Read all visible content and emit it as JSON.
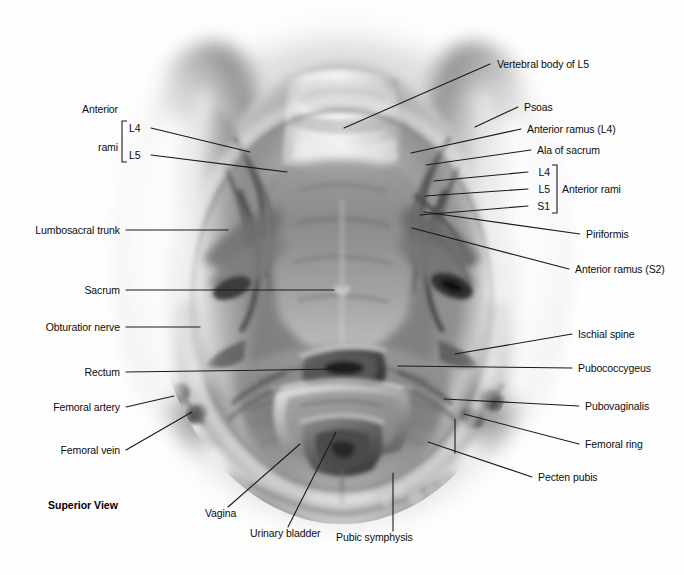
{
  "figure": {
    "view_label": "Superior View",
    "background_color": "#ffffff",
    "label_color": "#0d0d0d",
    "leader_color": "#1a1a1a",
    "width": 684,
    "height": 575
  },
  "brackets": {
    "left": {
      "title_line1": "Anterior",
      "title_line2": "rami",
      "items": [
        "L4",
        "L5"
      ]
    },
    "right": {
      "title": "Anterior rami",
      "items": [
        "L4",
        "L5",
        "S1"
      ]
    }
  },
  "labels": {
    "left": [
      {
        "text": "Lumbosacral trunk",
        "x": 120,
        "y": 230
      },
      {
        "text": "Sacrum",
        "x": 120,
        "y": 290
      },
      {
        "text": "Obturatior nerve",
        "x": 120,
        "y": 327
      },
      {
        "text": "Rectum",
        "x": 120,
        "y": 372
      },
      {
        "text": "Femoral artery",
        "x": 120,
        "y": 407
      },
      {
        "text": "Femoral vein",
        "x": 120,
        "y": 450
      }
    ],
    "right": [
      {
        "text": "Vertebral body of L5",
        "x": 497,
        "y": 64
      },
      {
        "text": "Psoas",
        "x": 524,
        "y": 107
      },
      {
        "text": "Anterior ramus (L4)",
        "x": 527,
        "y": 129
      },
      {
        "text": "Ala of sacrum",
        "x": 537,
        "y": 150
      },
      {
        "text": "Piriformis",
        "x": 586,
        "y": 234
      },
      {
        "text": "Anterior ramus (S2)",
        "x": 575,
        "y": 269
      },
      {
        "text": "Ischial spine",
        "x": 578,
        "y": 334
      },
      {
        "text": "Pubococcygeus",
        "x": 578,
        "y": 368
      },
      {
        "text": "Pubovaginalis",
        "x": 585,
        "y": 406
      },
      {
        "text": "Femoral ring",
        "x": 585,
        "y": 444
      },
      {
        "text": "Pecten pubis",
        "x": 538,
        "y": 477
      }
    ],
    "bottom": [
      {
        "text": "Vagina",
        "x": 205,
        "y": 513
      },
      {
        "text": "Urinary bladder",
        "x": 250,
        "y": 533
      },
      {
        "text": "Pubic symphysis",
        "x": 336,
        "y": 537
      }
    ]
  },
  "leaders": [
    {
      "name": "lumbosacral-trunk",
      "points": "126,230 228,230"
    },
    {
      "name": "sacrum",
      "points": "126,290 334,290"
    },
    {
      "name": "obturator-nerve",
      "points": "126,327 200,327"
    },
    {
      "name": "rectum",
      "points": "126,372 340,369"
    },
    {
      "name": "femoral-artery",
      "points": "126,407 174,396"
    },
    {
      "name": "femoral-vein",
      "points": "126,450 192,412"
    },
    {
      "name": "anterior-rami-L4-left",
      "points": "151,128 250,152"
    },
    {
      "name": "anterior-rami-L5-left",
      "points": "151,155 287,172"
    },
    {
      "name": "vertebral-body-L5",
      "points": "490,64 344,128"
    },
    {
      "name": "psoas",
      "points": "518,107 475,127"
    },
    {
      "name": "anterior-ramus-L4",
      "points": "521,129 411,153"
    },
    {
      "name": "ala-of-sacrum",
      "points": "531,150 426,165"
    },
    {
      "name": "rami-L4-right",
      "points": "528,172 434,181"
    },
    {
      "name": "rami-L5-right",
      "points": "528,189 425,196"
    },
    {
      "name": "rami-S1-right",
      "points": "528,206 420,215"
    },
    {
      "name": "piriformis",
      "points": "580,234 424,212"
    },
    {
      "name": "anterior-ramus-S2",
      "points": "569,269 412,228"
    },
    {
      "name": "ischial-spine",
      "points": "572,334 455,354"
    },
    {
      "name": "pubococcygeus",
      "points": "572,368 398,366"
    },
    {
      "name": "pubovaginalis",
      "points": "579,406 444,399"
    },
    {
      "name": "femoral-ring",
      "points": "579,444 464,414"
    },
    {
      "name": "pecten-pubis",
      "points": "532,477 428,442"
    },
    {
      "name": "pecten-pubis-tick",
      "points": "455,419 455,453"
    },
    {
      "name": "vagina",
      "points": "228,507 300,444"
    },
    {
      "name": "urinary-bladder",
      "points": "288,527 336,432"
    },
    {
      "name": "pubic-symphysis",
      "points": "393,531 393,473"
    }
  ]
}
